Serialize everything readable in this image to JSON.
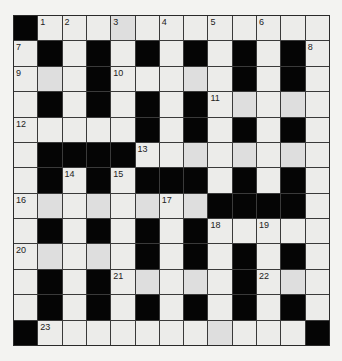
{
  "puzzle": {
    "rows": 13,
    "cols": 13,
    "colors": {
      "block": "#050505",
      "cell": "#ececea",
      "background": "#f3f3f1"
    },
    "grid": [
      "#........ ...#",
      ".#.#.#.#.#.#.",
      "...#.....#.#.",
      ".#.#.#.#.....",
      ".....#.#.#.#.",
      ".####........",
      ".#.#.###.#.#.",
      "........####.",
      ".#.#.#.#.....",
      ".....#.#.#.#.",
      ".#.#.....#...",
      ".#.#.#.#.#.#.",
      "#...........#"
    ],
    "numbers": [
      {
        "r": 0,
        "c": 1,
        "n": "1"
      },
      {
        "r": 0,
        "c": 2,
        "n": "2"
      },
      {
        "r": 0,
        "c": 4,
        "n": "3"
      },
      {
        "r": 0,
        "c": 6,
        "n": "4"
      },
      {
        "r": 0,
        "c": 8,
        "n": "5"
      },
      {
        "r": 0,
        "c": 10,
        "n": "6"
      },
      {
        "r": 1,
        "c": 0,
        "n": "7"
      },
      {
        "r": 1,
        "c": 12,
        "n": "8"
      },
      {
        "r": 2,
        "c": 0,
        "n": "9"
      },
      {
        "r": 2,
        "c": 4,
        "n": "10"
      },
      {
        "r": 3,
        "c": 8,
        "n": "11"
      },
      {
        "r": 4,
        "c": 0,
        "n": "12"
      },
      {
        "r": 5,
        "c": 5,
        "n": "13"
      },
      {
        "r": 6,
        "c": 2,
        "n": "14"
      },
      {
        "r": 6,
        "c": 4,
        "n": "15"
      },
      {
        "r": 7,
        "c": 0,
        "n": "16"
      },
      {
        "r": 7,
        "c": 6,
        "n": "17"
      },
      {
        "r": 8,
        "c": 8,
        "n": "18"
      },
      {
        "r": 8,
        "c": 10,
        "n": "19"
      },
      {
        "r": 9,
        "c": 0,
        "n": "20"
      },
      {
        "r": 10,
        "c": 4,
        "n": "21"
      },
      {
        "r": 10,
        "c": 10,
        "n": "22"
      },
      {
        "r": 12,
        "c": 1,
        "n": "23"
      }
    ]
  }
}
